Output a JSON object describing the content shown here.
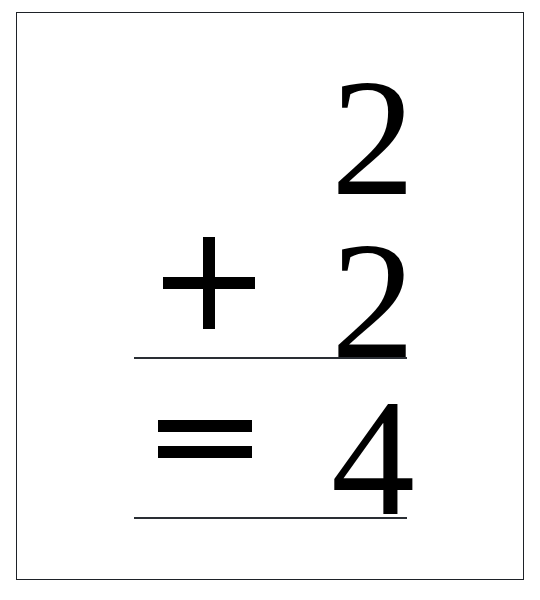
{
  "card": {
    "kind": "math-flashcard",
    "orientation": "portrait",
    "border_color": "#1e2228",
    "background_color": "#ffffff",
    "ink_color": "#000000",
    "rule_color": "#2a2e34"
  },
  "problem": {
    "type": "addition",
    "layout": "vertical-stacked",
    "expression": "2 + 2 = 4",
    "first_operand": "2",
    "operator_add": "+",
    "operator_add_name": "plus-sign",
    "second_operand": "2",
    "operator_equals": "=",
    "operator_equals_name": "equals-sign",
    "answer": "4",
    "rules": [
      {
        "name": "sum-rule",
        "label": ""
      },
      {
        "name": "answer-rule",
        "label": ""
      }
    ]
  }
}
